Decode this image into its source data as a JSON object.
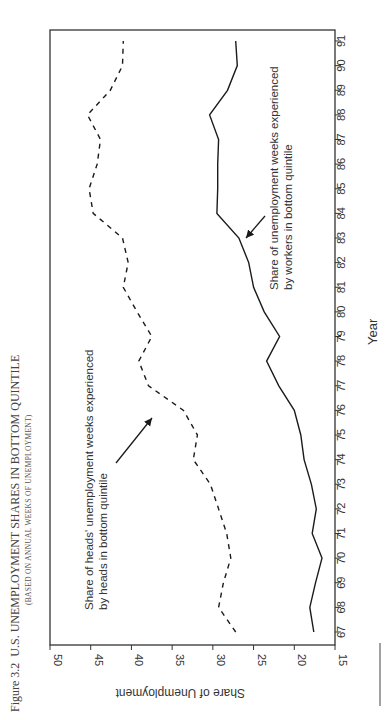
{
  "figure": {
    "number": "Figure 3.2",
    "title": "U.S. UNEMPLOYMENT SHARES IN BOTTOM QUINTILE",
    "subtitle": "(BASED ON ANNUAL WEEKS OF UNEMPLOYMENT)"
  },
  "chart_data": {
    "type": "line",
    "title": "U.S. UNEMPLOYMENT SHARES IN BOTTOM QUINTILE",
    "subtitle": "(BASED ON ANNUAL WEEKS OF UNEMPLOYMENT)",
    "xlabel": "Year",
    "ylabel": "Share of Unemployment",
    "orientation": "rotated 90 degrees clockwise (years run vertically, share axis runs horizontally)",
    "x": [
      67,
      68,
      69,
      70,
      71,
      72,
      73,
      74,
      75,
      76,
      77,
      78,
      79,
      80,
      81,
      82,
      83,
      84,
      85,
      86,
      87,
      88,
      89,
      90,
      91
    ],
    "xticks": [
      "67",
      "68",
      "69",
      "70",
      "71",
      "72",
      "73",
      "74",
      "75",
      "76",
      "77",
      "78",
      "79",
      "80",
      "81",
      "82",
      "83",
      "84",
      "85",
      "86",
      "87",
      "88",
      "89",
      "90",
      "91"
    ],
    "ylim": [
      15,
      50
    ],
    "yticks": [
      "15",
      "20",
      "25",
      "30",
      "35",
      "40",
      "45",
      "50"
    ],
    "grid": false,
    "series": [
      {
        "name": "Share of heads' unemployment weeks experienced by heads in bottom quintile",
        "style": "dashed",
        "values": [
          27.2,
          29.3,
          28.7,
          27.8,
          28.3,
          29.3,
          30.3,
          32.4,
          31.9,
          33.6,
          37.9,
          39.1,
          37.5,
          39.3,
          41.0,
          40.4,
          41.1,
          44.7,
          45.2,
          44.2,
          43.8,
          45.4,
          42.6,
          41.1,
          41.0
        ]
      },
      {
        "name": "Share of unemployment weeks experienced by workers in bottom quintile",
        "style": "solid",
        "values": [
          17.6,
          18.1,
          17.4,
          16.6,
          17.8,
          17.3,
          17.9,
          18.8,
          19.2,
          20.0,
          21.9,
          23.4,
          21.8,
          23.7,
          25.0,
          25.6,
          26.8,
          29.5,
          29.4,
          29.4,
          29.3,
          30.4,
          28.2,
          27.0,
          27.2
        ]
      }
    ],
    "annotations": [
      {
        "text_line1": "Share of heads' unemployment weeks experienced",
        "text_line2": "by heads in bottom quintile",
        "arrow_to": "dashed series near 1976"
      },
      {
        "text_line1": "Share of unemployment weeks experienced",
        "text_line2": "by workers in bottom quintile",
        "arrow_to": "solid series near 1983"
      }
    ]
  },
  "labels": {
    "ylabel": "Share of Unemployment",
    "xlabel": "Year",
    "heads_line1": "Share of heads' unemployment weeks experienced",
    "heads_line2": "by heads in bottom quintile",
    "workers_line1": "Share of unemployment weeks experienced",
    "workers_line2": "by workers in bottom quintile"
  },
  "colors": {
    "line": "#1a1a1a",
    "axis": "#333333",
    "caption": "#444444"
  }
}
